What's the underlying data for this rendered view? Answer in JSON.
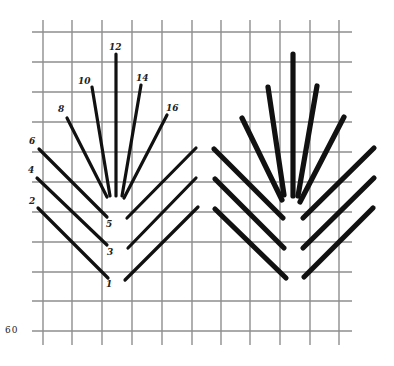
{
  "figure": {
    "page_number": "60",
    "grid": {
      "vertical_x": [
        43,
        72,
        102,
        132,
        162,
        192,
        221,
        250,
        280,
        310,
        339
      ],
      "horizontal_y": [
        32,
        62,
        92,
        122,
        152,
        182,
        212,
        242,
        272,
        301,
        331
      ],
      "x_extent": [
        32,
        352
      ],
      "y_extent": [
        20,
        345
      ],
      "color": "#8e8e8e"
    },
    "left_diagram": {
      "stitch_labels": [
        {
          "text": "12",
          "x": 109,
          "y": 43
        },
        {
          "text": "10",
          "x": 78,
          "y": 77
        },
        {
          "text": "14",
          "x": 136,
          "y": 74
        },
        {
          "text": "8",
          "x": 58,
          "y": 105
        },
        {
          "text": "16",
          "x": 166,
          "y": 104
        },
        {
          "text": "6",
          "x": 29,
          "y": 137
        },
        {
          "text": "4",
          "x": 28,
          "y": 166
        },
        {
          "text": "2",
          "x": 29,
          "y": 197
        },
        {
          "text": "5",
          "x": 106,
          "y": 220
        },
        {
          "text": "3",
          "x": 107,
          "y": 248
        },
        {
          "text": "1",
          "x": 106,
          "y": 280
        }
      ],
      "stitches": [
        {
          "x1": 116,
          "y1": 54,
          "x2": 116,
          "y2": 196
        },
        {
          "x1": 92,
          "y1": 87,
          "x2": 110,
          "y2": 196
        },
        {
          "x1": 141,
          "y1": 85,
          "x2": 122,
          "y2": 196
        },
        {
          "x1": 67,
          "y1": 118,
          "x2": 107,
          "y2": 197
        },
        {
          "x1": 167,
          "y1": 115,
          "x2": 124,
          "y2": 198
        },
        {
          "x1": 39,
          "y1": 149,
          "x2": 107,
          "y2": 217
        },
        {
          "x1": 37,
          "y1": 178,
          "x2": 107,
          "y2": 245
        },
        {
          "x1": 38,
          "y1": 208,
          "x2": 108,
          "y2": 278
        },
        {
          "x1": 196,
          "y1": 148,
          "x2": 127,
          "y2": 218
        },
        {
          "x1": 196,
          "y1": 178,
          "x2": 128,
          "y2": 248
        },
        {
          "x1": 198,
          "y1": 207,
          "x2": 125,
          "y2": 280
        }
      ]
    },
    "right_diagram": {
      "stitches": [
        {
          "x1": 293,
          "y1": 54,
          "x2": 293,
          "y2": 196
        },
        {
          "x1": 268,
          "y1": 87,
          "x2": 284,
          "y2": 195
        },
        {
          "x1": 317,
          "y1": 86,
          "x2": 298,
          "y2": 196
        },
        {
          "x1": 242,
          "y1": 118,
          "x2": 282,
          "y2": 200
        },
        {
          "x1": 344,
          "y1": 117,
          "x2": 300,
          "y2": 202
        },
        {
          "x1": 214,
          "y1": 149,
          "x2": 283,
          "y2": 218
        },
        {
          "x1": 215,
          "y1": 179,
          "x2": 284,
          "y2": 248
        },
        {
          "x1": 215,
          "y1": 209,
          "x2": 286,
          "y2": 278
        },
        {
          "x1": 374,
          "y1": 148,
          "x2": 303,
          "y2": 218
        },
        {
          "x1": 374,
          "y1": 178,
          "x2": 303,
          "y2": 248
        },
        {
          "x1": 373,
          "y1": 208,
          "x2": 304,
          "y2": 277
        }
      ]
    }
  }
}
